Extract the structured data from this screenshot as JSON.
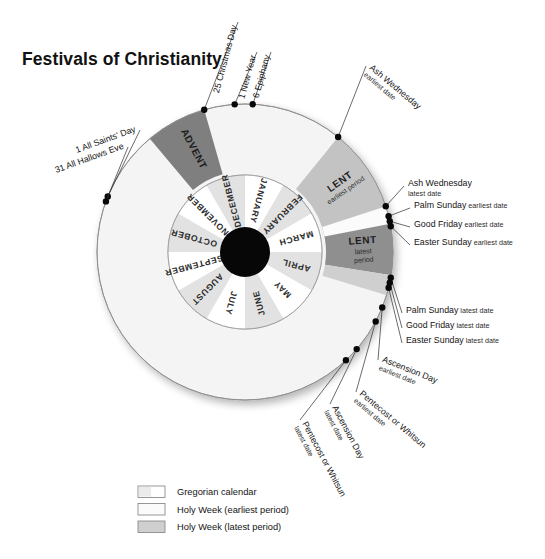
{
  "title": "Festivals of Christianity",
  "colors": {
    "outer_ring": "#f4f4f4",
    "outer_ring_stroke": "#8d8d8d",
    "advent": "#7f7f7f",
    "lent_earliest": "#c3c3c3",
    "lent_latest": "#8f8f8f",
    "holy_week_earliest": "#fbfbfb",
    "holy_week_latest": "#cfcfcf",
    "month_light": "#ffffff",
    "month_shade": "#e2e2e2",
    "hub": "#070707",
    "text": "#141414",
    "leader": "#3a3a3a"
  },
  "inner_ring": {
    "months": [
      "JANUARY",
      "FEBRUARY",
      "MARCH",
      "APRIL",
      "MAY",
      "JUNE",
      "JULY",
      "AUGUST",
      "SEPTEMBER",
      "OCTOBER",
      "NOVEMBER",
      "DECEMBER"
    ]
  },
  "seasons": [
    {
      "name": "ADVENT",
      "sub": ""
    },
    {
      "name": "LENT",
      "sub": "earliest period"
    },
    {
      "name": "LENT",
      "sub": "latest period"
    }
  ],
  "markers": [
    {
      "id": "christmas-day",
      "main": "25 Christmas Day",
      "sub": ""
    },
    {
      "id": "new-year",
      "main": "1 New Year",
      "sub": ""
    },
    {
      "id": "epiphany",
      "main": "6 Epiphany",
      "sub": ""
    },
    {
      "id": "ash-wednesday-earliest",
      "main": "Ash Wednesday",
      "sub": "earliest date"
    },
    {
      "id": "ash-wednesday-latest",
      "main": "Ash Wednesday",
      "sub": "latest date"
    },
    {
      "id": "palm-sunday-earliest",
      "main": "Palm Sunday",
      "sub": "earliest date"
    },
    {
      "id": "good-friday-earliest",
      "main": "Good Friday",
      "sub": "earliest date"
    },
    {
      "id": "easter-sunday-earliest",
      "main": "Easter Sunday",
      "sub": "earliest date"
    },
    {
      "id": "palm-sunday-latest",
      "main": "Palm Sunday",
      "sub": "latest date"
    },
    {
      "id": "good-friday-latest",
      "main": "Good Friday",
      "sub": "latest date"
    },
    {
      "id": "easter-sunday-latest",
      "main": "Easter Sunday",
      "sub": "latest date"
    },
    {
      "id": "ascension-day-earliest",
      "main": "Ascension Day",
      "sub": "earliest date"
    },
    {
      "id": "pentecost-earliest",
      "main": "Pentecost or Whitsun",
      "sub": "earliest date"
    },
    {
      "id": "ascension-day-latest",
      "main": "Ascension Day",
      "sub": "latest date"
    },
    {
      "id": "pentecost-latest",
      "main": "Pentecost or Whitsun",
      "sub": "latest date"
    },
    {
      "id": "all-saints-day",
      "main": "1 All Saints' Day",
      "sub": ""
    },
    {
      "id": "all-hallows-eve",
      "main": "31 All Hallows Eve",
      "sub": ""
    }
  ],
  "legend": [
    {
      "label": "Gregorian calendar",
      "swatch": "#ffffff"
    },
    {
      "label": "Holy Week (earliest period)",
      "swatch": "#fbfbfb"
    },
    {
      "label": "Holy Week (latest period)",
      "swatch": "#cfcfcf"
    }
  ]
}
